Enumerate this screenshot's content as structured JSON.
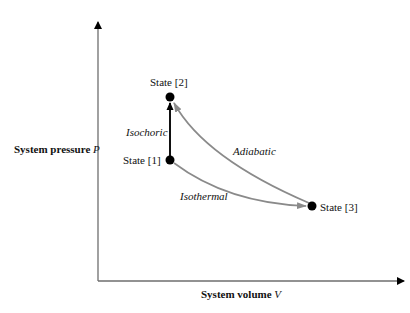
{
  "diagram": {
    "axes": {
      "y_label": "System pressure",
      "y_var": "P",
      "x_label": "System volume",
      "x_var": "V"
    },
    "states": [
      {
        "id": "state-1",
        "label": "State [1]",
        "x": 170,
        "y": 160
      },
      {
        "id": "state-2",
        "label": "State [2]",
        "x": 170,
        "y": 97
      },
      {
        "id": "state-3",
        "label": "State [3]",
        "x": 312,
        "y": 206
      }
    ],
    "processes": [
      {
        "id": "isochoric",
        "label": "Isochoric",
        "from": "State [1]",
        "to": "State [2]",
        "color": "#111111"
      },
      {
        "id": "adiabatic",
        "label": "Adiabatic",
        "from": "State [3]",
        "to": "State [2]",
        "color": "#8a8a8a"
      },
      {
        "id": "isothermal",
        "label": "Isothermal",
        "from": "State [1]",
        "to": "State [3]",
        "color": "#8a8a8a"
      }
    ],
    "colors": {
      "axis": "#6e6e6e",
      "dot": "#000000",
      "curve": "#8a8a8a",
      "isochoric": "#111111"
    }
  }
}
